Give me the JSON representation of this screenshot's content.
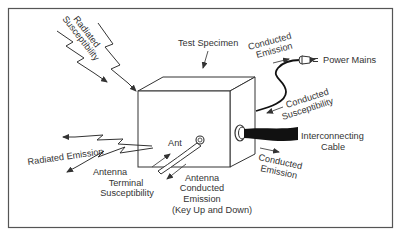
{
  "figure": {
    "type": "emc-test-diagram",
    "colors": {
      "ink": "#333333",
      "background": "#ffffff",
      "frame": "#555555",
      "cable": "#111111"
    }
  },
  "labels": {
    "test_specimen": "Test Specimen",
    "radiated_susceptibility_1": "Radiated",
    "radiated_susceptibility_2": "Susceptibility",
    "conducted_emission_top_1": "Conducted",
    "conducted_emission_top_2": "Emission",
    "power_mains": "Power Mains",
    "conducted_susceptibility_1": "Conducted",
    "conducted_susceptibility_2": "Susceptibility",
    "interconnecting_cable_1": "Interconnecting",
    "interconnecting_cable_2": "Cable",
    "conducted_emission_bottom_1": "Conducted",
    "conducted_emission_bottom_2": "Emission",
    "radiated_emission": "Radiated Emission",
    "ant": "Ant",
    "antenna_terminal_susceptibility_1": "Antenna",
    "antenna_terminal_susceptibility_2": "Terminal",
    "antenna_terminal_susceptibility_3": "Susceptibility",
    "antenna_conducted_emission_1": "Antenna",
    "antenna_conducted_emission_2": "Conducted",
    "antenna_conducted_emission_3": "Emission",
    "antenna_conducted_emission_4": "(Key Up and Down)"
  },
  "icons": {
    "lightning_arrows": "zigzag-lightning-arrow",
    "plug": "power-plug",
    "box": "test-specimen-box",
    "cable": "interconnecting-cable",
    "antenna_connector": "antenna-connector"
  }
}
